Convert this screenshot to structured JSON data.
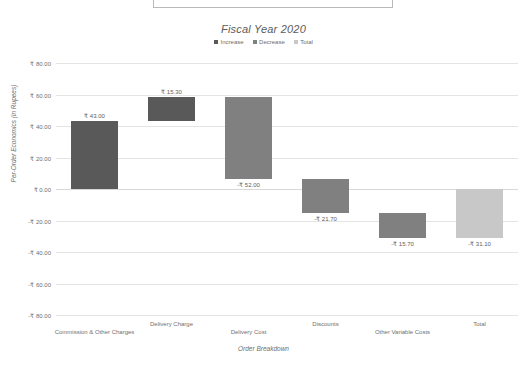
{
  "chart_data": {
    "type": "bar",
    "chart_subtype": "waterfall",
    "title": "Fiscal Year 2020",
    "xlabel": "Order Breakdown",
    "ylabel": "Per-Order Economics (in Rupees)",
    "categories": [
      "Commission & Other Charges",
      "Delivery Charge",
      "Delivery Cost",
      "Discounts",
      "Other Variable Costs",
      "Total"
    ],
    "values": [
      43.0,
      15.3,
      -52.0,
      -21.7,
      -15.7,
      -31.1
    ],
    "data_labels": [
      "₹ 43.00",
      "₹ 15.30",
      "-₹ 52.00",
      "-₹ 21.70",
      "-₹ 15.70",
      "-₹ 31.10"
    ],
    "bar_types": [
      "increase",
      "increase",
      "decrease",
      "decrease",
      "decrease",
      "total"
    ],
    "cumulative_start": [
      0.0,
      43.0,
      58.3,
      6.3,
      -15.4,
      0.0
    ],
    "cumulative_end": [
      43.0,
      58.3,
      6.3,
      -15.4,
      -31.1,
      -31.1
    ],
    "label_position": [
      "above",
      "above",
      "below",
      "below",
      "below",
      "below"
    ],
    "ylim": [
      -80,
      80
    ],
    "yticks": [
      80,
      60,
      40,
      20,
      0,
      -20,
      -40,
      -60,
      -80
    ],
    "ytick_labels": [
      "₹ 80.00",
      "₹ 60.00",
      "₹ 40.00",
      "₹ 20.00",
      "₹ 0.00",
      "-₹ 20.00",
      "-₹ 40.00",
      "-₹ 60.00",
      "-₹ 80.00"
    ],
    "grid": true,
    "legend_position": "top",
    "legend": [
      {
        "label": "Increase",
        "color": "#595959"
      },
      {
        "label": "Decrease",
        "color": "#808080"
      },
      {
        "label": "Total",
        "color": "#c8c8c8"
      }
    ],
    "colors": {
      "increase": "#595959",
      "decrease": "#808080",
      "total": "#c8c8c8",
      "gridline": "#e4e4e4",
      "text": "#6f6f6f"
    }
  }
}
